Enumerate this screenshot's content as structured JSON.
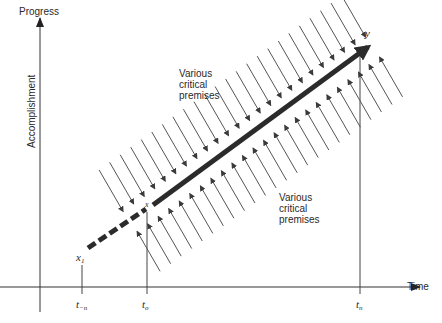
{
  "axes": {
    "y_title": "Progress",
    "y_label": "Accomplishment",
    "x_title": "Time"
  },
  "points": {
    "start": "x",
    "start_sub": "1",
    "midpoint": "x",
    "end": "y"
  },
  "ticks": {
    "t_minus_n": "t",
    "t_minus_n_sub": "−n",
    "t_zero": "t",
    "t_zero_sub": "o",
    "t_n": "t",
    "t_n_sub": "n"
  },
  "annotations": {
    "upper_premises": "Various\ncritical\npremises",
    "lower_premises": "Various\ncritical\npremises"
  },
  "colors": {
    "line": "#333333",
    "thick_arrow": "#2b2b2b",
    "text": "#2a2a2a"
  }
}
